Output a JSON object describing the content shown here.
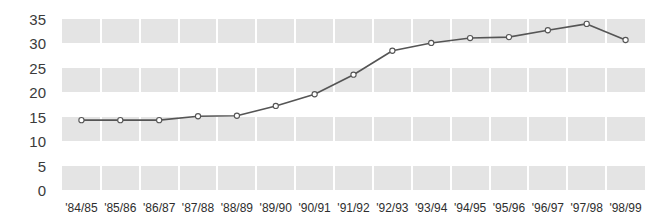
{
  "chart_data": {
    "type": "line",
    "title": "",
    "subtitle": "",
    "xlabel": "",
    "ylabel": "",
    "categories": [
      "'84/85",
      "'85/86",
      "'86/87",
      "'87/88",
      "'88/89",
      "'89/90",
      "'90/91",
      "'91/92",
      "'92/93",
      "'93/94",
      "'94/95",
      "'95/96",
      "'96/97",
      "'97/98",
      "'98/99"
    ],
    "values": [
      14.3,
      14.3,
      14.3,
      15.1,
      15.2,
      17.2,
      19.6,
      23.6,
      28.5,
      30.1,
      31.1,
      31.3,
      32.7,
      34.0,
      30.7
    ],
    "series": [
      {
        "name": "series-1",
        "values": [
          14.3,
          14.3,
          14.3,
          15.1,
          15.2,
          17.2,
          19.6,
          23.6,
          28.5,
          30.1,
          31.1,
          31.3,
          32.7,
          34.0,
          30.7
        ]
      }
    ],
    "ylim": [
      0,
      35
    ],
    "yticks": [
      0,
      5,
      10,
      15,
      20,
      25,
      30,
      35
    ],
    "ytick_labels": [
      "0",
      "5",
      "10",
      "15",
      "20",
      "25",
      "30",
      "35"
    ],
    "grid": "horizontal-bands",
    "legend": "none",
    "marker": "open-circle",
    "line_color": "#555555",
    "marker_fill": "#ffffff",
    "band_color": "#e4e4e4",
    "background_color": "#ffffff",
    "axis_text_color": "#3b3b3b",
    "bands": [
      {
        "from": 0,
        "to": 5
      },
      {
        "from": 10,
        "to": 15
      },
      {
        "from": 20,
        "to": 25
      },
      {
        "from": 30,
        "to": 35
      }
    ]
  }
}
